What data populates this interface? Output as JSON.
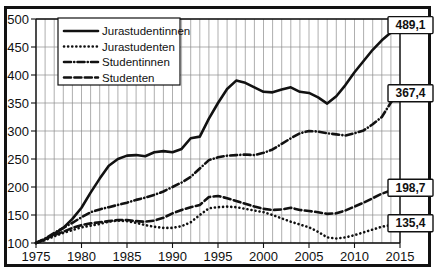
{
  "figure": {
    "name": "law-students-index-chart",
    "background": "#ffffff",
    "border_color": "#111111"
  },
  "chart_data": {
    "type": "line",
    "title": "",
    "subtitle": "",
    "xlabel": "",
    "ylabel": "",
    "xlim": [
      1975,
      2015
    ],
    "ylim": [
      100,
      500
    ],
    "yticks": [
      100,
      150,
      200,
      250,
      300,
      350,
      400,
      450,
      500
    ],
    "xticks": [
      1975,
      1980,
      1985,
      1990,
      1995,
      2000,
      2005,
      2010,
      2015
    ],
    "xtick_labels": [
      "1975",
      "1980",
      "1985",
      "1990",
      "1995",
      "2000",
      "2005",
      "2010",
      "2015"
    ],
    "ytick_labels": [
      "100",
      "150",
      "200",
      "250",
      "300",
      "350",
      "400",
      "450",
      "500"
    ],
    "grid": "both",
    "minor_x_gridlines": "every year",
    "legend_position": "upper-left-inside",
    "x": [
      1975,
      1976,
      1977,
      1978,
      1979,
      1980,
      1981,
      1982,
      1983,
      1984,
      1985,
      1986,
      1987,
      1988,
      1989,
      1990,
      1991,
      1992,
      1993,
      1994,
      1995,
      1996,
      1997,
      1998,
      1999,
      2000,
      2001,
      2002,
      2003,
      2004,
      2005,
      2006,
      2007,
      2008,
      2009,
      2010,
      2011,
      2012,
      2013,
      2014,
      2015
    ],
    "series": [
      {
        "name": "Jurastudentinnen",
        "style": "solid",
        "end_value": "489,1",
        "values": [
          100,
          107,
          116,
          127,
          143,
          163,
          190,
          215,
          238,
          250,
          256,
          257,
          255,
          262,
          264,
          262,
          268,
          287,
          290,
          322,
          350,
          375,
          390,
          386,
          378,
          370,
          369,
          374,
          378,
          370,
          368,
          360,
          349,
          362,
          382,
          405,
          425,
          445,
          462,
          476,
          489.1
        ]
      },
      {
        "name": "Jurastudenten",
        "style": "dotted",
        "end_value": "135,4",
        "values": [
          100,
          105,
          112,
          118,
          123,
          128,
          131,
          134,
          138,
          140,
          139,
          136,
          132,
          129,
          127,
          127,
          130,
          137,
          150,
          162,
          164,
          165,
          164,
          161,
          158,
          155,
          150,
          144,
          138,
          133,
          128,
          120,
          110,
          108,
          110,
          114,
          119,
          124,
          129,
          132,
          135.4
        ]
      },
      {
        "name": "Studentinnen",
        "style": "dashdot",
        "end_value": "367,4",
        "values": [
          100,
          108,
          118,
          127,
          136,
          146,
          155,
          160,
          164,
          168,
          172,
          177,
          181,
          186,
          192,
          200,
          208,
          218,
          233,
          248,
          253,
          256,
          257,
          258,
          257,
          261,
          267,
          277,
          287,
          296,
          300,
          299,
          296,
          294,
          292,
          296,
          301,
          312,
          325,
          351,
          367.4
        ]
      },
      {
        "name": "Studenten",
        "style": "dashed",
        "end_value": "198,7",
        "values": [
          100,
          107,
          114,
          120,
          127,
          132,
          135,
          137,
          139,
          141,
          141,
          139,
          138,
          140,
          145,
          153,
          159,
          164,
          168,
          182,
          184,
          180,
          175,
          170,
          165,
          161,
          159,
          160,
          163,
          159,
          157,
          155,
          152,
          153,
          158,
          165,
          172,
          180,
          188,
          194,
          198.7
        ]
      }
    ],
    "end_labels": [
      {
        "text": "489,1",
        "series": "Jurastudentinnen"
      },
      {
        "text": "367,4",
        "series": "Studentinnen"
      },
      {
        "text": "198,7",
        "series": "Studenten"
      },
      {
        "text": "135,4",
        "series": "Jurastudenten"
      }
    ],
    "legend_entries": [
      {
        "label": "Jurastudentinnen",
        "style": "solid"
      },
      {
        "label": "Jurastudenten",
        "style": "dotted"
      },
      {
        "label": "Studentinnen",
        "style": "dashdot"
      },
      {
        "label": "Studenten",
        "style": "dashed"
      }
    ]
  }
}
